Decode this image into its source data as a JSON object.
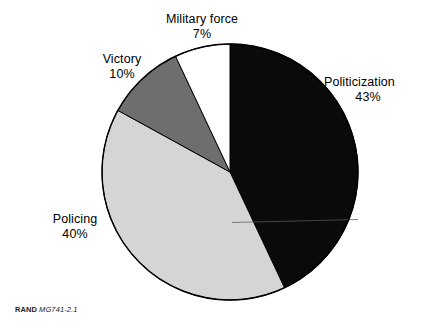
{
  "footer": {
    "brand": "RAND",
    "document_id": "MG741-2.1"
  },
  "chart_data": {
    "type": "pie",
    "title": "",
    "subtitle": "",
    "xlabel": "",
    "ylabel": "",
    "legend_position": "labels-outside-slices",
    "grid": false,
    "units": "percent",
    "start_angle_deg": 0,
    "direction": "clockwise",
    "center": {
      "x": 230,
      "y": 172
    },
    "radius": 128,
    "categories": [
      "Politicization",
      "Policing",
      "Victory",
      "Military force"
    ],
    "values": [
      43,
      40,
      10,
      7
    ],
    "slices": [
      {
        "label": "Politicization",
        "value": 43,
        "value_text": "43%",
        "color": "#0a0a0a",
        "start_deg": 0,
        "end_deg": 154.8
      },
      {
        "label": "Policing",
        "value": 40,
        "value_text": "40%",
        "color": "#d5d5d5",
        "start_deg": 154.8,
        "end_deg": 298.8
      },
      {
        "label": "Victory",
        "value": 10,
        "value_text": "10%",
        "color": "#6e6e6e",
        "start_deg": 298.8,
        "end_deg": 334.8
      },
      {
        "label": "Military force",
        "value": 7,
        "value_text": "7%",
        "color": "#ffffff",
        "start_deg": 334.8,
        "end_deg": 360
      }
    ]
  }
}
